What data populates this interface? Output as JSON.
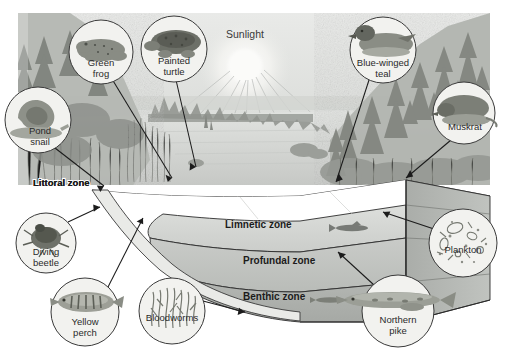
{
  "figure": {
    "background_color": "#ffffff",
    "photo_tone": "#c9cbc8"
  },
  "sun": {
    "label": "Sunlight",
    "x": 245,
    "y": 38,
    "glow_color": "#f2f2ef"
  },
  "zones": [
    {
      "id": "littoral",
      "label": "Littoral zone",
      "x": 33,
      "y": 186,
      "fill": "#b9bcb7"
    },
    {
      "id": "limnetic",
      "label": "Limnetic zone",
      "x": 225,
      "y": 228,
      "fill": "#d0d2cf"
    },
    {
      "id": "profundal",
      "label": "Profundal zone",
      "x": 243,
      "y": 264,
      "fill": "#c2c4c1"
    },
    {
      "id": "benthic",
      "label": "Benthic zone",
      "x": 243,
      "y": 300,
      "fill": "#b4b7b3"
    }
  ],
  "callouts": [
    {
      "id": "green-frog",
      "label_lines": [
        "Green",
        "frog"
      ],
      "cx": 101,
      "cy": 52,
      "r": 32,
      "pointer": {
        "x1": 112,
        "y1": 79,
        "x2": 172,
        "y2": 178
      }
    },
    {
      "id": "painted-turtle",
      "label_lines": [
        "Painted",
        "turtle"
      ],
      "cx": 174,
      "cy": 49,
      "r": 33,
      "pointer": {
        "x1": 176,
        "y1": 80,
        "x2": 196,
        "y2": 167
      }
    },
    {
      "id": "pond-snail",
      "label_lines": [
        "Pond",
        "snail"
      ],
      "cx": 38,
      "cy": 120,
      "r": 33,
      "pointer": {
        "x1": 55,
        "y1": 148,
        "x2": 104,
        "y2": 186
      }
    },
    {
      "id": "blue-winged-teal",
      "label_lines": [
        "Blue-winged",
        "teal"
      ],
      "cx": 383,
      "cy": 50,
      "r": 33,
      "pointer": {
        "x1": 369,
        "y1": 80,
        "x2": 336,
        "y2": 182
      }
    },
    {
      "id": "muskrat",
      "label_lines": [
        "Muskrat"
      ],
      "cx": 464,
      "cy": 113,
      "r": 31,
      "pointer": {
        "x1": 451,
        "y1": 140,
        "x2": 406,
        "y2": 178
      }
    },
    {
      "id": "diving-beetle",
      "label_lines": [
        "Diving",
        "beetle"
      ],
      "cx": 46,
      "cy": 243,
      "r": 30,
      "pointer": {
        "x1": 68,
        "y1": 222,
        "x2": 100,
        "y2": 207
      }
    },
    {
      "id": "yellow-perch",
      "label_lines": [
        "Yellow",
        "perch"
      ],
      "cx": 85,
      "cy": 312,
      "r": 34,
      "pointer": {
        "x1": 107,
        "y1": 289,
        "x2": 143,
        "y2": 218
      }
    },
    {
      "id": "bloodworms",
      "label_lines": [
        "Bloodworms"
      ],
      "cx": 172,
      "cy": 311,
      "r": 33,
      "pointer": {
        "x1": 203,
        "y1": 301,
        "x2": 245,
        "y2": 312
      }
    },
    {
      "id": "northern-pike",
      "label_lines": [
        "Northern",
        "pike"
      ],
      "cx": 398,
      "cy": 311,
      "r": 36,
      "pointer": {
        "x1": 374,
        "y1": 285,
        "x2": 338,
        "y2": 252
      }
    },
    {
      "id": "plankton",
      "label_lines": [
        "Plankton"
      ],
      "cx": 463,
      "cy": 243,
      "r": 34,
      "pointer": {
        "x1": 434,
        "y1": 229,
        "x2": 383,
        "y2": 212
      }
    }
  ],
  "colors": {
    "line": "#1f1f1f",
    "circle_stroke": "#3a3a3a",
    "circle_fill": "#f1f1ee",
    "water_surface": "#d6d8d5",
    "water_deep": "#b7bab6",
    "side_face": "#a9aca8",
    "land": "#b0b3ae"
  }
}
